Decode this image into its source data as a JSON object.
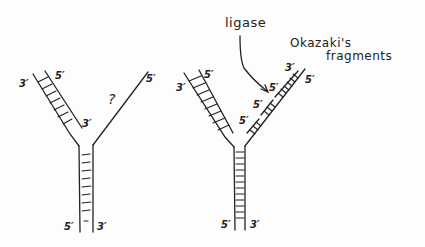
{
  "diagram": {
    "left_fork": {
      "labels": {
        "left_arm_outer": "3′",
        "left_arm_inner_top": "5′",
        "left_arm_inner_end": "3′",
        "right_arm_top": "5′",
        "question": "?",
        "stem_left": "5′",
        "stem_right": "3′"
      }
    },
    "right_fork": {
      "labels": {
        "left_arm_outer": "3′",
        "left_arm_inner_top": "5′",
        "fragment_1": "5′",
        "fragment_2": "5′",
        "fragment_3": "5′",
        "fragment_top": "3′",
        "right_arm_top": "5′",
        "stem_left": "5′",
        "stem_right": "3′"
      },
      "annotations": {
        "ligase": "ligase",
        "okazaki_line1": "Okazaki's",
        "okazaki_line2": "fragments"
      }
    },
    "stroke_color": "#222222"
  }
}
